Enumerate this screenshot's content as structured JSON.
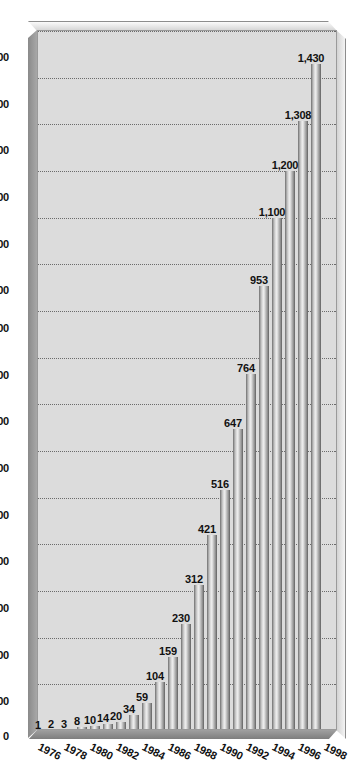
{
  "chart_data": {
    "type": "bar",
    "orientation": "horizontal",
    "title": "",
    "subtitle": "",
    "xlabel": "",
    "ylabel": "",
    "categories": [
      "1976",
      "1977",
      "1978",
      "1979",
      "1980",
      "1981",
      "1982",
      "1983",
      "1984",
      "1985",
      "1986",
      "1987",
      "1988",
      "1989",
      "1990",
      "1991",
      "1992",
      "1993",
      "1994",
      "1995",
      "1996",
      "1997",
      "1998"
    ],
    "values": [
      1,
      2,
      3,
      8,
      10,
      14,
      20,
      34,
      59,
      104,
      159,
      230,
      312,
      421,
      516,
      647,
      764,
      953,
      1100,
      1200,
      1308,
      1430,
      0
    ],
    "data_labels": [
      "1",
      "2",
      "3",
      "8",
      "10",
      "14",
      "20",
      "34",
      "59",
      "104",
      "159",
      "230",
      "312",
      "421",
      "516",
      "647",
      "764",
      "953",
      "1,100",
      "1,200",
      "1,308",
      "1,430",
      ""
    ],
    "visible_category_labels": [
      "1976",
      "1978",
      "1980",
      "1982",
      "1984",
      "1986",
      "1988",
      "1990",
      "1992",
      "1994",
      "1996",
      "1998"
    ],
    "xlim": [
      0,
      1500
    ],
    "tick_labels": [
      "0",
      "100",
      "200",
      "300",
      "400",
      "500",
      "600",
      "700",
      "800",
      "900",
      "1,000",
      "1,100",
      "1,200",
      "1,300",
      "1,400",
      "1,500"
    ],
    "tick_values": [
      0,
      100,
      200,
      300,
      400,
      500,
      600,
      700,
      800,
      900,
      1000,
      1100,
      1200,
      1300,
      1400,
      1500
    ],
    "grid": true,
    "grid_style": "dotted-vertical",
    "legend": "none",
    "bar_fill": "#bdbdbd",
    "plot_background": "#dcdcdc",
    "frame_style": "3d-bevel"
  },
  "colors": {
    "plot_bg": "#dcdcdc",
    "frame_light": "#f4f4f4",
    "frame_dark": "#8a8a8a",
    "grid": "#6b6b6b",
    "text": "#111111",
    "bar_highlight": "#efefef",
    "bar_shadow": "#5f5f5f"
  }
}
